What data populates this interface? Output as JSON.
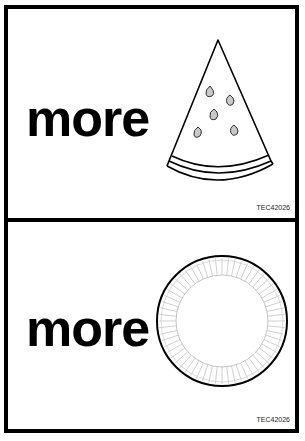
{
  "cards": [
    {
      "word": "more",
      "picture": "watermelon-slice-icon",
      "code": "TEC42026"
    },
    {
      "word": "more",
      "picture": "paper-plate-icon",
      "code": "TEC42026"
    }
  ],
  "colors": {
    "ink": "#000000",
    "seed_fill": "#c8c8c8",
    "plate_ridges": "#bdbdbd",
    "background": "#ffffff"
  }
}
